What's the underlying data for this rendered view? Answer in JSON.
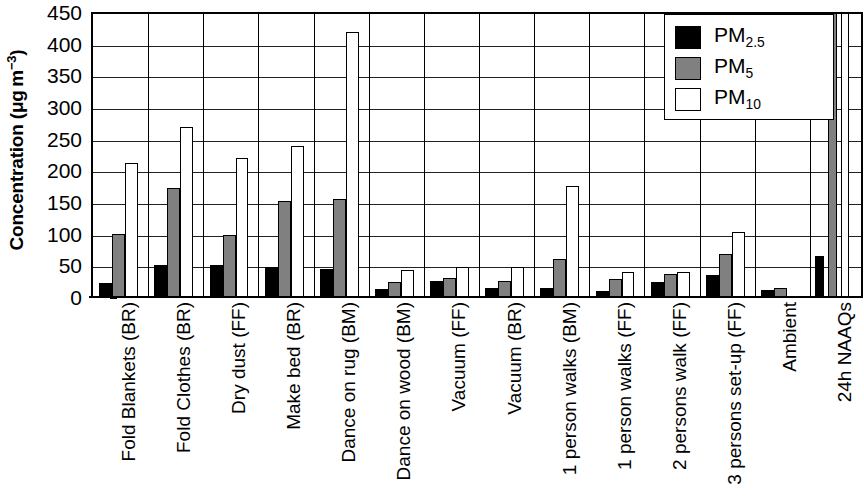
{
  "chart_data": {
    "type": "bar",
    "title": "",
    "xlabel": "",
    "ylabel": "Concentration (μg m⁻³)",
    "ylim": [
      0,
      450
    ],
    "yticks": [
      0,
      50,
      100,
      150,
      200,
      250,
      300,
      350,
      400,
      450
    ],
    "grid": true,
    "legend_position": "top-right",
    "categories": [
      "Fold Blankets (BR)",
      "Fold Clothes (BR)",
      "Dry dust (FF)",
      "Make bed (BR)",
      "Dance on rug (BM)",
      "Dance on wood (BM)",
      "Vacuum (FF)",
      "Vacuum (BR)",
      "1 person walks (BM)",
      "1 person walks (FF)",
      "2 persons walk (FF)",
      "3 persons set-up (FF)",
      "Ambient",
      "24h NAAQs"
    ],
    "series": [
      {
        "name": "PM2.5",
        "label_html": "PM<sub>2.5</sub>",
        "color": "#000000",
        "values": [
          22,
          50,
          50,
          48,
          45,
          12,
          25,
          15,
          15,
          10,
          24,
          34,
          11,
          65
        ]
      },
      {
        "name": "PM5",
        "label_html": "PM<sub>5</sub>",
        "color": "#808080",
        "values": [
          100,
          172,
          98,
          151,
          155,
          23,
          30,
          26,
          60,
          28,
          37,
          68,
          14,
          155
        ]
      },
      {
        "name": "PM10",
        "label_html": "PM<sub>10</sub>",
        "color": "#ffffff",
        "values": [
          211,
          268,
          220,
          238,
          418,
          43,
          48,
          47,
          175,
          39,
          40,
          102,
          0,
          155
        ]
      }
    ]
  },
  "axis": {
    "y_title_main": "Concentration (",
    "y_title_unit_mu": "μg m",
    "y_title_exp": "−3",
    "y_title_close": ")"
  },
  "legend": {
    "entries": [
      {
        "label": "PM",
        "sub": "2.5",
        "swatch": "pm25"
      },
      {
        "label": "PM",
        "sub": "5",
        "swatch": "pm5"
      },
      {
        "label": "PM",
        "sub": "10",
        "swatch": "pm10"
      }
    ]
  }
}
